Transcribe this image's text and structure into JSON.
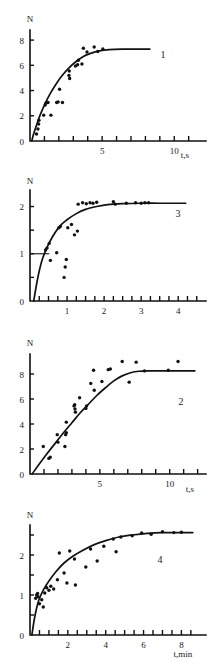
{
  "figure": {
    "background": "#ffffff",
    "ink_color": "#1a1a1a",
    "panel_count": 4
  },
  "chart_data": [
    {
      "id": "panel-1",
      "type": "scatter",
      "curve_label": "1",
      "title": "",
      "xlabel": "t,s",
      "ylabel": "N",
      "xlim": [
        0,
        12.2
      ],
      "ylim": [
        0,
        8.8
      ],
      "xticks": [
        1,
        2,
        3,
        4,
        5,
        6,
        7,
        8,
        9,
        10,
        11
      ],
      "xticklabels": [
        {
          "value": 5,
          "text": "5"
        },
        {
          "value": 10,
          "text": "10"
        }
      ],
      "yticks": [
        2,
        4,
        6,
        8
      ],
      "yticklabels": [
        {
          "value": 0,
          "text": "0"
        },
        {
          "value": 2,
          "text": "2"
        },
        {
          "value": 4,
          "text": "4"
        },
        {
          "value": 6,
          "text": "6"
        },
        {
          "value": 8,
          "text": "8"
        }
      ],
      "grid": false,
      "fit_curve": {
        "model": "saturating-exponential",
        "points": [
          [
            0.12,
            0.0
          ],
          [
            0.25,
            0.55
          ],
          [
            0.45,
            1.25
          ],
          [
            0.7,
            2.05
          ],
          [
            1.0,
            2.85
          ],
          [
            1.4,
            3.75
          ],
          [
            1.8,
            4.5
          ],
          [
            2.2,
            5.15
          ],
          [
            2.7,
            5.8
          ],
          [
            3.2,
            6.3
          ],
          [
            3.7,
            6.7
          ],
          [
            4.2,
            6.95
          ],
          [
            4.8,
            7.15
          ],
          [
            5.5,
            7.25
          ],
          [
            6.5,
            7.28
          ],
          [
            7.5,
            7.28
          ],
          [
            8.3,
            7.28
          ]
        ]
      },
      "scatter_points": [
        [
          0.45,
          0.55
        ],
        [
          0.55,
          0.95
        ],
        [
          0.6,
          1.35
        ],
        [
          0.62,
          1.65
        ],
        [
          0.95,
          2.05
        ],
        [
          1.05,
          2.85
        ],
        [
          1.1,
          3.0
        ],
        [
          1.25,
          3.05
        ],
        [
          1.45,
          2.05
        ],
        [
          1.85,
          3.05
        ],
        [
          1.95,
          3.1
        ],
        [
          2.05,
          4.1
        ],
        [
          2.25,
          3.05
        ],
        [
          2.7,
          5.2
        ],
        [
          2.72,
          5.55
        ],
        [
          2.75,
          4.95
        ],
        [
          3.15,
          5.95
        ],
        [
          3.3,
          6.05
        ],
        [
          3.35,
          6.4
        ],
        [
          3.6,
          6.1
        ],
        [
          3.95,
          7.05
        ],
        [
          3.7,
          7.35
        ],
        [
          4.45,
          7.45
        ],
        [
          4.7,
          7.1
        ],
        [
          5.05,
          7.3
        ]
      ]
    },
    {
      "id": "panel-2",
      "type": "scatter",
      "curve_label": "3",
      "title": "",
      "xlabel": "",
      "ylabel": "N",
      "xlim": [
        0,
        4.75
      ],
      "ylim": [
        0,
        2.35
      ],
      "xticks": [
        0.25,
        0.5,
        0.75,
        1,
        1.25,
        1.5,
        1.75,
        2,
        2.25,
        2.5,
        2.75,
        3,
        3.25,
        3.5,
        3.75,
        4,
        4.25,
        4.5
      ],
      "xticklabels": [
        {
          "value": 1,
          "text": "1"
        },
        {
          "value": 2,
          "text": "2"
        },
        {
          "value": 3,
          "text": "3"
        },
        {
          "value": 4,
          "text": "4"
        }
      ],
      "yticks": [
        0.5,
        1,
        1.5,
        2
      ],
      "yticklabels": [
        {
          "value": 0,
          "text": "0"
        },
        {
          "value": 1,
          "text": "1"
        },
        {
          "value": 2,
          "text": "2"
        }
      ],
      "grid": false,
      "reference_line": {
        "y": 1.0,
        "x_from": 0.0,
        "x_to": 0.52
      },
      "fit_curve": {
        "model": "saturating-exponential",
        "points": [
          [
            0.1,
            0.0
          ],
          [
            0.2,
            0.45
          ],
          [
            0.32,
            0.85
          ],
          [
            0.45,
            1.12
          ],
          [
            0.6,
            1.35
          ],
          [
            0.8,
            1.58
          ],
          [
            1.0,
            1.72
          ],
          [
            1.25,
            1.85
          ],
          [
            1.5,
            1.94
          ],
          [
            1.8,
            2.0
          ],
          [
            2.1,
            2.04
          ],
          [
            2.5,
            2.06
          ],
          [
            3.0,
            2.07
          ],
          [
            3.5,
            2.07
          ],
          [
            4.2,
            2.07
          ]
        ]
      },
      "scatter_points": [
        [
          0.42,
          1.08
        ],
        [
          0.46,
          1.12
        ],
        [
          0.52,
          1.22
        ],
        [
          0.55,
          0.86
        ],
        [
          0.72,
          1.02
        ],
        [
          0.78,
          1.55
        ],
        [
          0.82,
          1.58
        ],
        [
          0.95,
          0.72
        ],
        [
          0.98,
          0.88
        ],
        [
          1.02,
          1.55
        ],
        [
          1.12,
          1.62
        ],
        [
          0.92,
          0.5
        ],
        [
          1.2,
          1.4
        ],
        [
          1.28,
          1.48
        ],
        [
          1.3,
          2.05
        ],
        [
          1.42,
          2.08
        ],
        [
          1.52,
          2.06
        ],
        [
          1.62,
          2.08
        ],
        [
          1.7,
          2.07
        ],
        [
          1.8,
          2.09
        ],
        [
          2.25,
          2.1
        ],
        [
          2.3,
          2.05
        ],
        [
          2.6,
          2.07
        ],
        [
          2.85,
          2.08
        ],
        [
          3.0,
          2.07
        ],
        [
          3.1,
          2.08
        ],
        [
          3.2,
          2.08
        ]
      ]
    },
    {
      "id": "panel-3",
      "type": "scatter",
      "curve_label": "2",
      "title": "",
      "xlabel": "t,s",
      "ylabel": "N",
      "xlim": [
        0,
        12.6
      ],
      "ylim": [
        0,
        9.6
      ],
      "xticks": [
        1,
        2,
        3,
        4,
        5,
        6,
        7,
        8,
        9,
        10,
        11,
        12
      ],
      "xticklabels": [
        {
          "value": 5,
          "text": "5"
        },
        {
          "value": 10,
          "text": "10"
        }
      ],
      "yticks": [
        2,
        4,
        6,
        8
      ],
      "yticklabels": [
        {
          "value": 0,
          "text": "0"
        },
        {
          "value": 2,
          "text": "2"
        },
        {
          "value": 4,
          "text": "4"
        },
        {
          "value": 6,
          "text": "6"
        },
        {
          "value": 8,
          "text": "8"
        }
      ],
      "grid": false,
      "fit_curve": {
        "model": "sigmoid-saturating",
        "points": [
          [
            0.15,
            0.0
          ],
          [
            0.6,
            0.7
          ],
          [
            1.2,
            1.6
          ],
          [
            1.8,
            2.45
          ],
          [
            2.4,
            3.3
          ],
          [
            3.0,
            4.1
          ],
          [
            3.6,
            4.9
          ],
          [
            4.2,
            5.6
          ],
          [
            4.8,
            6.3
          ],
          [
            5.4,
            6.9
          ],
          [
            6.0,
            7.45
          ],
          [
            6.6,
            7.85
          ],
          [
            7.2,
            8.1
          ],
          [
            7.8,
            8.22
          ],
          [
            8.6,
            8.25
          ],
          [
            9.6,
            8.25
          ],
          [
            10.8,
            8.25
          ],
          [
            11.8,
            8.25
          ]
        ]
      },
      "scatter_points": [
        [
          0.95,
          2.2
        ],
        [
          1.35,
          1.25
        ],
        [
          1.45,
          1.35
        ],
        [
          1.95,
          3.15
        ],
        [
          2.0,
          2.55
        ],
        [
          2.5,
          2.2
        ],
        [
          2.55,
          3.15
        ],
        [
          2.6,
          3.3
        ],
        [
          2.6,
          4.15
        ],
        [
          3.15,
          5.45
        ],
        [
          3.2,
          5.55
        ],
        [
          3.22,
          5.2
        ],
        [
          3.25,
          4.95
        ],
        [
          3.55,
          6.1
        ],
        [
          4.0,
          5.25
        ],
        [
          4.05,
          5.45
        ],
        [
          4.55,
          8.3
        ],
        [
          4.6,
          6.7
        ],
        [
          4.35,
          7.25
        ],
        [
          5.15,
          7.4
        ],
        [
          5.6,
          8.35
        ],
        [
          5.75,
          8.4
        ],
        [
          6.6,
          9.0
        ],
        [
          7.6,
          8.95
        ],
        [
          7.1,
          7.35
        ],
        [
          8.2,
          8.25
        ],
        [
          9.9,
          8.3
        ],
        [
          10.6,
          9.0
        ]
      ]
    },
    {
      "id": "panel-4",
      "type": "scatter",
      "curve_label": "4",
      "title": "",
      "xlabel": "t,min",
      "ylabel": "N",
      "xlim": [
        0,
        9.3
      ],
      "ylim": [
        0,
        2.75
      ],
      "xticks": [
        0.5,
        1,
        1.5,
        2,
        2.5,
        3,
        3.5,
        4,
        4.5,
        5,
        5.5,
        6,
        6.5,
        7,
        7.5,
        8,
        8.5
      ],
      "xticklabels": [
        {
          "value": 2,
          "text": "2"
        },
        {
          "value": 4,
          "text": "4"
        },
        {
          "value": 6,
          "text": "6"
        },
        {
          "value": 8,
          "text": "8"
        }
      ],
      "yticks": [
        0.5,
        1,
        1.5,
        2,
        2.5
      ],
      "yticklabels": [
        {
          "value": 0,
          "text": "0"
        },
        {
          "value": 1,
          "text": "1"
        },
        {
          "value": 2,
          "text": "2"
        }
      ],
      "grid": false,
      "fit_curve": {
        "model": "saturating-exponential",
        "points": [
          [
            0.1,
            0.0
          ],
          [
            0.25,
            0.45
          ],
          [
            0.45,
            0.85
          ],
          [
            0.7,
            1.12
          ],
          [
            1.0,
            1.35
          ],
          [
            1.4,
            1.6
          ],
          [
            1.8,
            1.8
          ],
          [
            2.3,
            1.98
          ],
          [
            2.8,
            2.12
          ],
          [
            3.4,
            2.26
          ],
          [
            4.0,
            2.36
          ],
          [
            4.7,
            2.45
          ],
          [
            5.4,
            2.5
          ],
          [
            6.2,
            2.54
          ],
          [
            7.0,
            2.56
          ],
          [
            7.8,
            2.56
          ],
          [
            8.6,
            2.56
          ]
        ]
      },
      "scatter_points": [
        [
          0.3,
          0.92
        ],
        [
          0.35,
          1.0
        ],
        [
          0.4,
          1.04
        ],
        [
          0.42,
          0.96
        ],
        [
          0.5,
          0.78
        ],
        [
          0.62,
          0.88
        ],
        [
          0.7,
          0.7
        ],
        [
          0.78,
          1.05
        ],
        [
          0.88,
          1.18
        ],
        [
          1.0,
          1.12
        ],
        [
          1.1,
          1.22
        ],
        [
          1.25,
          1.15
        ],
        [
          1.45,
          1.38
        ],
        [
          1.55,
          2.05
        ],
        [
          1.8,
          1.55
        ],
        [
          1.95,
          1.3
        ],
        [
          2.1,
          2.1
        ],
        [
          2.35,
          1.9
        ],
        [
          2.4,
          1.25
        ],
        [
          2.95,
          1.7
        ],
        [
          3.2,
          2.15
        ],
        [
          3.55,
          1.85
        ],
        [
          3.9,
          2.22
        ],
        [
          4.4,
          2.4
        ],
        [
          4.55,
          2.08
        ],
        [
          4.8,
          2.45
        ],
        [
          5.4,
          2.48
        ],
        [
          5.9,
          2.55
        ],
        [
          6.4,
          2.52
        ],
        [
          7.0,
          2.58
        ],
        [
          7.6,
          2.56
        ],
        [
          8.0,
          2.57
        ]
      ]
    }
  ]
}
